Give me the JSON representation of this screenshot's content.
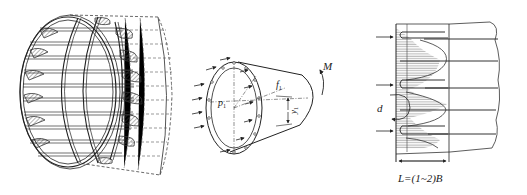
{
  "figure": {
    "background": "#ffffff",
    "line_color": "#333333",
    "panels": [
      {
        "id": "a",
        "description": "Cage of longitudinal bars and circular hoops inside a cylindrical shell with hatched bulges",
        "labels": []
      },
      {
        "id": "b",
        "description": "Cylinder with end-face pressure arrows and moment",
        "labels": {
          "moment": "M",
          "pressure": "p",
          "pressure_sub": "1",
          "force": "f",
          "force_sub": "1",
          "offset": "y",
          "offset_sub": "1"
        }
      },
      {
        "id": "c",
        "description": "Longitudinal section with bar spacing, hatched stress bulbs and arrows",
        "labels": {
          "diameter": "d",
          "length_formula": "L=(1~2)B"
        }
      }
    ]
  }
}
